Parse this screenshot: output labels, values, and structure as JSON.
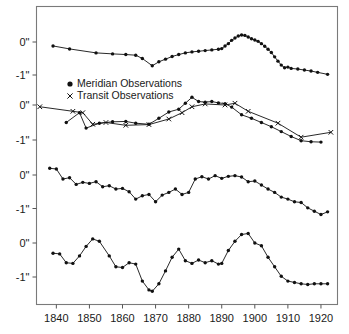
{
  "figure": {
    "background": "#ffffff",
    "frame_color": "#7a7a7a",
    "line_color": "#111111"
  },
  "axis": {
    "x_tick_labels": [
      "1840",
      "1850",
      "1860",
      "1870",
      "1880",
      "1890",
      "1900",
      "1910",
      "1920"
    ],
    "x_tick_values": [
      1840,
      1850,
      1860,
      1870,
      1880,
      1890,
      1900,
      1910,
      1920
    ],
    "x_range": [
      1834,
      1925
    ],
    "y_tick_labels": [
      "0\"",
      "-1\""
    ],
    "y_tick_values": [
      0,
      -1
    ]
  },
  "panels": [
    {
      "name": "Sun",
      "label": "Sun"
    },
    {
      "name": "Mercury",
      "label": "Mercury"
    },
    {
      "name": "Venus",
      "label": "Venus"
    },
    {
      "name": "Mars",
      "label": "Mars"
    }
  ],
  "legend": {
    "items": [
      {
        "label": "Meridian Observations",
        "marker": "filled-circle"
      },
      {
        "label": "Transit Observations",
        "marker": "x-cross"
      }
    ]
  },
  "chart_data": {
    "type": "line",
    "title": "",
    "xlabel": "",
    "ylabel": "",
    "xlim": [
      1834,
      1925
    ],
    "grid": false,
    "legend_position": "upper-left-inside",
    "panels": [
      {
        "name": "Sun",
        "ylim": [
          -1.45,
          0.55
        ],
        "yticks": [
          0,
          -1
        ],
        "series": [
          {
            "name": "Sun",
            "marker": "filled-circle",
            "x": [
              1839,
              1844,
              1852,
              1857,
              1861,
              1864,
              1866,
              1869,
              1871,
              1873,
              1875,
              1877,
              1879,
              1881,
              1883,
              1885,
              1887,
              1889,
              1890,
              1891,
              1892,
              1893,
              1894,
              1895,
              1896,
              1897,
              1898,
              1899,
              1900,
              1901,
              1902,
              1903,
              1904,
              1905,
              1906,
              1907,
              1908,
              1909,
              1910,
              1911,
              1913,
              1915,
              1917,
              1919,
              1922
            ],
            "y": [
              -0.12,
              -0.21,
              -0.33,
              -0.36,
              -0.38,
              -0.4,
              -0.5,
              -0.72,
              -0.6,
              -0.52,
              -0.44,
              -0.38,
              -0.33,
              -0.3,
              -0.28,
              -0.26,
              -0.24,
              -0.22,
              -0.2,
              -0.12,
              -0.05,
              0.05,
              0.12,
              0.18,
              0.21,
              0.2,
              0.15,
              0.1,
              0.06,
              0.02,
              -0.05,
              -0.13,
              -0.22,
              -0.32,
              -0.45,
              -0.58,
              -0.7,
              -0.78,
              -0.76,
              -0.8,
              -0.82,
              -0.85,
              -0.88,
              -0.92,
              -0.98
            ]
          }
        ]
      },
      {
        "name": "Mercury",
        "ylim": [
          -1.45,
          0.55
        ],
        "yticks": [
          0,
          -1
        ],
        "series": [
          {
            "name": "Meridian Observations",
            "marker": "filled-circle",
            "x": [
              1843,
              1847,
              1849,
              1853,
              1857,
              1861,
              1864,
              1868,
              1871,
              1874,
              1877,
              1879,
              1881,
              1883,
              1885,
              1887,
              1889,
              1891,
              1893,
              1896,
              1899,
              1902,
              1905,
              1908,
              1911,
              1914,
              1917,
              1920
            ],
            "y": [
              -0.5,
              -0.22,
              -0.66,
              -0.52,
              -0.48,
              -0.47,
              -0.52,
              -0.55,
              -0.38,
              -0.2,
              -0.12,
              0.05,
              0.22,
              0.1,
              0.08,
              0.1,
              0.06,
              0.04,
              -0.06,
              -0.28,
              -0.38,
              -0.5,
              -0.62,
              -0.76,
              -0.9,
              -1.02,
              -1.05,
              -1.06
            ]
          },
          {
            "name": "Transit Observations",
            "marker": "x-cross",
            "x": [
              1835,
              1845,
              1848,
              1851,
              1855,
              1861,
              1868,
              1874,
              1878,
              1881,
              1885,
              1891,
              1894,
              1898,
              1907,
              1914,
              1923
            ],
            "y": [
              -0.05,
              -0.18,
              -0.22,
              -0.55,
              -0.5,
              -0.58,
              -0.56,
              -0.4,
              -0.22,
              -0.05,
              0.03,
              0.0,
              0.05,
              -0.18,
              -0.52,
              -0.92,
              -0.78
            ]
          }
        ]
      },
      {
        "name": "Venus",
        "ylim": [
          -1.45,
          0.55
        ],
        "yticks": [
          0,
          -1
        ],
        "series": [
          {
            "name": "Venus",
            "marker": "filled-circle",
            "x": [
              1838,
              1840,
              1842,
              1844,
              1846,
              1848,
              1850,
              1852,
              1854,
              1856,
              1858,
              1860,
              1862,
              1864,
              1866,
              1868,
              1870,
              1872,
              1874,
              1876,
              1878,
              1880,
              1882,
              1884,
              1886,
              1888,
              1890,
              1892,
              1894,
              1896,
              1898,
              1900,
              1902,
              1904,
              1906,
              1908,
              1910,
              1912,
              1914,
              1916,
              1918,
              1920,
              1922
            ],
            "y": [
              0.2,
              0.18,
              -0.12,
              -0.08,
              -0.28,
              -0.22,
              -0.25,
              -0.2,
              -0.35,
              -0.32,
              -0.42,
              -0.4,
              -0.5,
              -0.72,
              -0.62,
              -0.58,
              -0.8,
              -0.6,
              -0.52,
              -0.42,
              -0.58,
              -0.52,
              -0.12,
              -0.05,
              -0.12,
              -0.02,
              -0.1,
              -0.04,
              -0.02,
              -0.06,
              -0.2,
              -0.18,
              -0.3,
              -0.42,
              -0.52,
              -0.66,
              -0.72,
              -0.8,
              -0.82,
              -0.98,
              -1.08,
              -1.18,
              -1.1
            ]
          }
        ]
      },
      {
        "name": "Mars",
        "ylim": [
          -1.65,
          0.55
        ],
        "yticks": [
          0,
          -1
        ],
        "series": [
          {
            "name": "Mars",
            "marker": "filled-circle",
            "x": [
              1839,
              1841,
              1843,
              1845,
              1847,
              1849,
              1851,
              1853,
              1856,
              1858,
              1860,
              1862,
              1864,
              1866,
              1868,
              1869,
              1871,
              1873,
              1875,
              1877,
              1879,
              1881,
              1883,
              1885,
              1887,
              1889,
              1890,
              1892,
              1894,
              1896,
              1898,
              1900,
              1902,
              1904,
              1906,
              1908,
              1910,
              1912,
              1914,
              1916,
              1918,
              1920,
              1922
            ],
            "y": [
              -0.3,
              -0.32,
              -0.58,
              -0.6,
              -0.38,
              -0.1,
              0.12,
              0.05,
              -0.38,
              -0.7,
              -0.72,
              -0.58,
              -0.62,
              -1.12,
              -1.38,
              -1.42,
              -1.2,
              -0.82,
              -0.42,
              -0.18,
              -0.52,
              -0.6,
              -0.5,
              -0.58,
              -0.52,
              -0.62,
              -0.6,
              -0.22,
              0.05,
              0.25,
              0.28,
              0.0,
              -0.08,
              -0.42,
              -0.7,
              -0.98,
              -1.12,
              -1.16,
              -1.2,
              -1.22,
              -1.2,
              -1.2,
              -1.2
            ]
          }
        ]
      }
    ]
  }
}
